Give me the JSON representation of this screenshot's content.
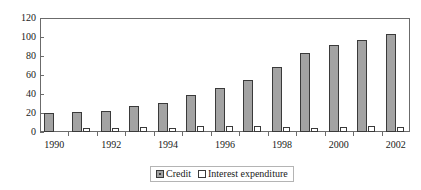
{
  "chart_data": {
    "type": "bar",
    "title": "",
    "subtitle": "",
    "xlabel": "",
    "ylabel": "",
    "ylim": [
      0,
      120
    ],
    "ytick_labels": [
      "120",
      "100",
      "80",
      "60",
      "40",
      "20",
      "0"
    ],
    "ytick_values": [
      120,
      100,
      80,
      60,
      40,
      20,
      0
    ],
    "grid": false,
    "legend_position": "bottom",
    "categories": [
      "1990",
      "1991",
      "1992",
      "1993",
      "1994",
      "1995",
      "1996",
      "1997",
      "1998",
      "1999",
      "2000",
      "2001",
      "2002"
    ],
    "visible_xtick_labels": [
      "1990",
      "1992",
      "1994",
      "1996",
      "1998",
      "2000",
      "2002"
    ],
    "series": [
      {
        "name": "Credit",
        "color": "#a3a3a3",
        "values": [
          20,
          21,
          22,
          27,
          31,
          39,
          46,
          55,
          68,
          83,
          92,
          97,
          103
        ]
      },
      {
        "name": "Interest expenditure",
        "color": "#ffffff",
        "values": [
          0,
          4,
          4,
          5,
          4,
          6,
          6,
          6,
          5,
          4,
          5,
          6,
          5
        ]
      }
    ]
  },
  "legend": {
    "entries": [
      {
        "label": "Credit",
        "swatch": "filled-square-icon"
      },
      {
        "label": "Interest expenditure",
        "swatch": "hollow-square-icon"
      }
    ]
  },
  "colors": {
    "axis": "#6b6b6b",
    "bar_border": "#3a3a3a",
    "credit_fill": "#a3a3a3",
    "interest_fill": "#ffffff",
    "text": "#1a1a1a",
    "legend_border": "#b4b4b4",
    "background": "#ffffff"
  }
}
